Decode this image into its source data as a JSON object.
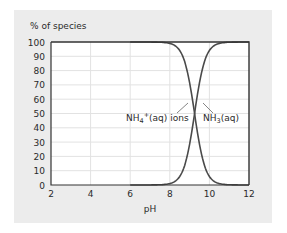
{
  "chart_data": {
    "type": "line",
    "title": "",
    "xlabel": "pH",
    "ylabel": "% of species",
    "xlim": [
      2,
      12
    ],
    "ylim": [
      0,
      100
    ],
    "x_ticks": [
      2,
      4,
      6,
      8,
      10,
      12
    ],
    "y_ticks": [
      0,
      10,
      20,
      30,
      40,
      50,
      60,
      70,
      80,
      90,
      100
    ],
    "grid": true,
    "legend_position": "inline-annotations",
    "series": [
      {
        "name": "NH4+(aq) ions",
        "label_main": "NH",
        "label_sub": "4",
        "label_sup": "+",
        "label_tail": "(aq) ions",
        "x": [
          2,
          4,
          6,
          7,
          7.5,
          8,
          8.5,
          9,
          9.25,
          9.5,
          10,
          10.5,
          11,
          12
        ],
        "values": [
          100,
          100,
          99.9,
          99.4,
          98.2,
          94.7,
          84.9,
          64.0,
          50.0,
          36.0,
          15.1,
          5.3,
          1.7,
          0.2
        ]
      },
      {
        "name": "NH3(aq)",
        "label_main": "NH",
        "label_sub": "3",
        "label_tail": "(aq)",
        "x": [
          2,
          4,
          6,
          7,
          7.5,
          8,
          8.5,
          9,
          9.25,
          9.5,
          10,
          10.5,
          11,
          12
        ],
        "values": [
          0,
          0,
          0.1,
          0.6,
          1.8,
          5.3,
          15.1,
          36.0,
          50.0,
          64.0,
          84.9,
          94.7,
          98.3,
          99.8
        ]
      }
    ],
    "annotations": [
      "crossover at pH ≈ 9.25, 50%"
    ],
    "colors": {
      "curve": "#4a4a4a",
      "grid": "#e2e2e2",
      "panel": "#ececec",
      "plot_bg": "#ffffff",
      "axis": "#333333"
    }
  }
}
